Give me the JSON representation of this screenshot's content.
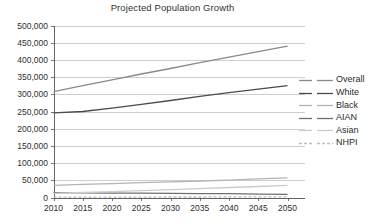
{
  "chart_data": {
    "type": "line",
    "title": "Projected Population Growth",
    "xlabel": "",
    "ylabel": "",
    "x": [
      2010,
      2015,
      2020,
      2025,
      2030,
      2035,
      2040,
      2045,
      2050
    ],
    "categories": [
      "2010",
      "2015",
      "2020",
      "2025",
      "2030",
      "2035",
      "2040",
      "2045",
      "2050"
    ],
    "xlim": [
      2010,
      2050
    ],
    "ylim": [
      0,
      500000
    ],
    "ytick_values": [
      0,
      50000,
      100000,
      150000,
      200000,
      250000,
      300000,
      350000,
      400000,
      450000,
      500000
    ],
    "ytick_labels": [
      "0",
      "50,000",
      "100,000",
      "150,000",
      "200,000",
      "250,000",
      "300,000",
      "350,000",
      "400,000",
      "450,000",
      "500,000"
    ],
    "grid": true,
    "grid_axis": "y",
    "legend_position": "right",
    "series": [
      {
        "name": "Overall",
        "color": "#8a8a8a",
        "width": 1.3,
        "dash": "none",
        "values": [
          308000,
          325000,
          342000,
          359000,
          375000,
          392000,
          408000,
          424000,
          440000
        ]
      },
      {
        "name": "White",
        "color": "#4a4a4a",
        "width": 1.3,
        "dash": "none",
        "values": [
          246000,
          250000,
          260000,
          271000,
          282000,
          294000,
          305000,
          315000,
          325000
        ]
      },
      {
        "name": "Black",
        "color": "#b4b4b4",
        "width": 1.3,
        "dash": "none",
        "values": [
          35000,
          38000,
          40500,
          43000,
          45500,
          48000,
          50500,
          54000,
          57000
        ]
      },
      {
        "name": "AIAN",
        "color": "#6e6e6e",
        "width": 1.3,
        "dash": "none",
        "values": [
          14000,
          13500,
          13000,
          12500,
          12000,
          11500,
          11000,
          10000,
          9000
        ]
      },
      {
        "name": "Asian",
        "color": "#cccccc",
        "width": 1.3,
        "dash": "none",
        "values": [
          12000,
          14500,
          17000,
          20000,
          23000,
          26000,
          29000,
          32000,
          35000
        ]
      },
      {
        "name": "NHPI",
        "color": "#bdbdbd",
        "width": 1.3,
        "dash": "3 2",
        "values": [
          1000,
          1100,
          1200,
          1300,
          1400,
          1500,
          1600,
          1700,
          1800
        ]
      }
    ]
  },
  "legend": {
    "entries": [
      {
        "label": "Overall"
      },
      {
        "label": "White"
      },
      {
        "label": "Black"
      },
      {
        "label": "AIAN"
      },
      {
        "label": "Asian"
      },
      {
        "label": "NHPI"
      }
    ]
  }
}
